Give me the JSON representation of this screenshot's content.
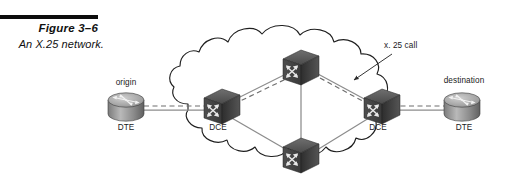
{
  "figure": {
    "number": "Figure 3–6",
    "title": "An X.25 network.",
    "rule_color": "#0d0d0d"
  },
  "diagram": {
    "type": "network-topology",
    "cloud_label": "",
    "annotation": {
      "text": "x. 25 call",
      "points_to": "dashed call path near right DCE"
    },
    "nodes": [
      {
        "id": "origin-dte",
        "icon": "router-icon",
        "top_label": "origin",
        "bottom_label": "DTE",
        "x": 126,
        "y": 105,
        "inside_cloud": false
      },
      {
        "id": "left-dce",
        "icon": "switch-icon",
        "top_label": "",
        "bottom_label": "DCE",
        "x": 218,
        "y": 105,
        "inside_cloud": true
      },
      {
        "id": "top-switch",
        "icon": "switch-icon",
        "top_label": "",
        "bottom_label": "",
        "x": 300,
        "y": 66,
        "inside_cloud": true
      },
      {
        "id": "bottom-switch",
        "icon": "switch-icon",
        "top_label": "",
        "bottom_label": "",
        "x": 300,
        "y": 154,
        "inside_cloud": true
      },
      {
        "id": "right-dce",
        "icon": "switch-icon",
        "top_label": "",
        "bottom_label": "DCE",
        "x": 378,
        "y": 105,
        "inside_cloud": true
      },
      {
        "id": "destination-dte",
        "icon": "router-icon",
        "top_label": "destination",
        "bottom_label": "DTE",
        "x": 462,
        "y": 105,
        "inside_cloud": false
      }
    ],
    "links": [
      {
        "from": "origin-dte",
        "to": "left-dce",
        "style": "solid"
      },
      {
        "from": "origin-dte",
        "to": "left-dce",
        "style": "dashed"
      },
      {
        "from": "left-dce",
        "to": "top-switch",
        "style": "solid"
      },
      {
        "from": "left-dce",
        "to": "top-switch",
        "style": "dashed"
      },
      {
        "from": "left-dce",
        "to": "bottom-switch",
        "style": "solid"
      },
      {
        "from": "top-switch",
        "to": "bottom-switch",
        "style": "solid"
      },
      {
        "from": "top-switch",
        "to": "right-dce",
        "style": "solid"
      },
      {
        "from": "top-switch",
        "to": "right-dce",
        "style": "dashed"
      },
      {
        "from": "bottom-switch",
        "to": "right-dce",
        "style": "solid"
      },
      {
        "from": "right-dce",
        "to": "destination-dte",
        "style": "solid"
      },
      {
        "from": "right-dce",
        "to": "destination-dte",
        "style": "dashed"
      }
    ],
    "colors": {
      "line": "#8c8c8c",
      "dashed_line": "#6e6e6e",
      "cloud_outline": "#1f1f1f",
      "icon_dark": "#3a3a3a",
      "icon_mid": "#6b6b6b",
      "icon_light": "#9d9d9d",
      "text": "#1a1a1a",
      "background": "#ffffff"
    }
  }
}
